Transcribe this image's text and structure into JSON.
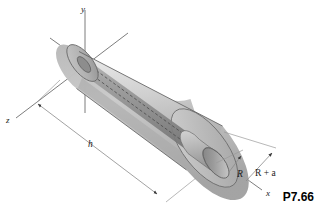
{
  "figure": {
    "number": "P7.66",
    "background_color": "#ffffff",
    "line_color": "#6e6e6e",
    "outline_color": "#5d5d5d"
  },
  "axes": [
    {
      "name": "y-axis",
      "label": "y"
    },
    {
      "name": "z-axis",
      "label": "z"
    },
    {
      "name": "x-axis",
      "label": "x"
    }
  ],
  "dimensions": [
    {
      "name": "height",
      "label": "h"
    },
    {
      "name": "inner-radius",
      "label": "R"
    },
    {
      "name": "outer-radius",
      "label": "R + a"
    }
  ],
  "geometry": {
    "shape_name": "truncated-cone-with-cylindrical-bore",
    "cone_fill_light": "#d8d8d8",
    "cone_fill_mid": "#c2c2c2",
    "cone_fill_dark": "#9a9a9a",
    "cylinder_fill": "#8e8e8e",
    "endcap_fill": "#b8b8b8"
  }
}
